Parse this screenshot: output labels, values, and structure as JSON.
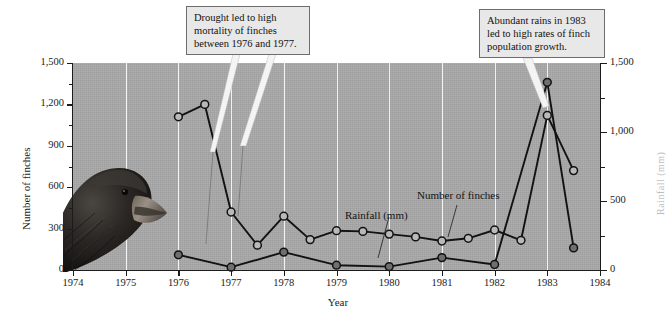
{
  "chart_data": {
    "type": "line",
    "title": "",
    "xlabel": "Year",
    "ylabel": "Number of finches",
    "ylabel_right": "Rainfall (mm)",
    "xlim": [
      1974,
      1984
    ],
    "ylim": [
      0,
      1500
    ],
    "ylim_right": [
      0,
      1500
    ],
    "grid": "vertical-only",
    "legend": "inline-labels",
    "xticks": [
      "1974",
      "1975",
      "1976",
      "1977",
      "1978",
      "1979",
      "1980",
      "1981",
      "1982",
      "1983",
      "1984"
    ],
    "yticks_left": [
      "0",
      "300",
      "600",
      "900",
      "1,200",
      "1,500"
    ],
    "yticks_right": [
      "0",
      "500",
      "1,000",
      "1,500"
    ],
    "series": [
      {
        "name": "Number of finches",
        "marker": "open-circle",
        "x": [
          1976,
          1976.5,
          1977,
          1977.5,
          1978,
          1978.5,
          1979,
          1979.5,
          1980,
          1980.5,
          1981,
          1981.5,
          1982,
          1982.5,
          1983,
          1983.5
        ],
        "values": [
          1110,
          1200,
          420,
          180,
          390,
          220,
          285,
          280,
          260,
          240,
          210,
          230,
          290,
          215,
          1120,
          720
        ]
      },
      {
        "name": "Rainfall (mm)",
        "marker": "filled-circle",
        "x": [
          1976,
          1977,
          1978,
          1979,
          1980,
          1981,
          1982,
          1983,
          1983.5
        ],
        "values": [
          110,
          20,
          130,
          35,
          25,
          90,
          40,
          1360,
          160
        ]
      }
    ],
    "annotations": [
      {
        "id": "drought-callout",
        "text": "Drought led to high mortality of finches between 1976 and 1977.",
        "lines": [
          "Drought led to high",
          "mortality of finches",
          "between 1976 and 1977."
        ]
      },
      {
        "id": "rains-callout",
        "text": "Abundant rains in 1983 led to high rates of finch population growth.",
        "lines": [
          "Abundant rains in 1983",
          "led to high rates of finch",
          "population growth."
        ]
      }
    ],
    "inline_labels": [
      {
        "id": "rainfall-label",
        "text": "Rainfall (mm)"
      },
      {
        "id": "finches-label",
        "text": "Number of finches"
      }
    ],
    "image": {
      "id": "finch-photo",
      "caption": "Darwin's finch (medium ground finch) head in profile"
    },
    "colors": {
      "plot_background": "#a9a9a9",
      "gridline": "#f2f2f2",
      "line": "#121212",
      "marker_open_fill": "#b9b9b9",
      "marker_filled": "#6f6f6f",
      "callout_background": "#e8e8e8",
      "callout_border": "#6d6d6d",
      "text": "#1b1b1b",
      "leader_light": "#f4f4f4"
    }
  }
}
